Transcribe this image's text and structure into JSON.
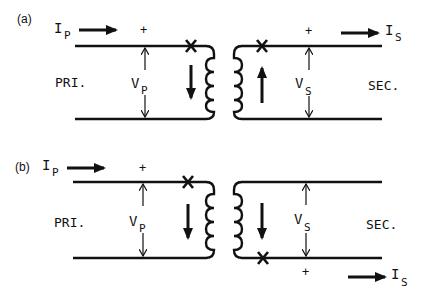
{
  "diagram": {
    "colors": {
      "ink": "#111111",
      "background": "#ffffff"
    },
    "panels": [
      {
        "id": "a",
        "label": "(a)",
        "primary": {
          "side_label": "PRI.",
          "current": "I",
          "current_sub": "P",
          "voltage": "V",
          "voltage_sub": "P",
          "plus": "+"
        },
        "secondary": {
          "side_label": "SEC.",
          "current": "I",
          "current_sub": "S",
          "voltage": "V",
          "voltage_sub": "S",
          "plus": "+"
        },
        "primary_flux_arrow": "down",
        "secondary_flux_arrow": "up",
        "secondary_polarity_mark": "top"
      },
      {
        "id": "b",
        "label": "(b)",
        "primary": {
          "side_label": "PRI.",
          "current": "I",
          "current_sub": "P",
          "voltage": "V",
          "voltage_sub": "P",
          "plus": "+"
        },
        "secondary": {
          "side_label": "SEC.",
          "current": "I",
          "current_sub": "S",
          "voltage": "V",
          "voltage_sub": "S",
          "plus": "+"
        },
        "primary_flux_arrow": "down",
        "secondary_flux_arrow": "down",
        "secondary_polarity_mark": "bottom"
      }
    ]
  }
}
